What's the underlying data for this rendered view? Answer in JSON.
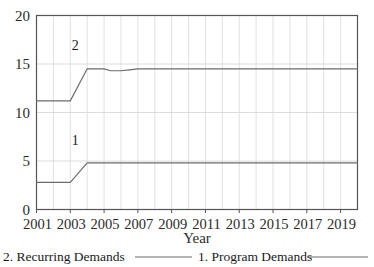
{
  "chart_data": {
    "type": "line",
    "title": "",
    "xlabel": "Year",
    "ylabel": "",
    "xlim": [
      2001,
      2020
    ],
    "ylim": [
      0,
      20
    ],
    "grid": true,
    "legend_position": "bottom",
    "y_ticks": [
      "0",
      "5",
      "10",
      "15",
      "20"
    ],
    "y_tick_values": [
      0,
      5,
      10,
      15,
      20
    ],
    "x_ticks": [
      "2001",
      "2003",
      "2005",
      "2007",
      "2009",
      "2011",
      "2013",
      "2015",
      "2017",
      "2019"
    ],
    "x_tick_values": [
      2001,
      2003,
      2005,
      2007,
      2009,
      2011,
      2013,
      2015,
      2017,
      2019
    ],
    "series": [
      {
        "name": "2. Recurring Demands",
        "tag": "2",
        "color": "#6b6b6b",
        "x": [
          2001,
          2003,
          2004,
          2005,
          2005.4,
          2006,
          2006.5,
          2007,
          2020
        ],
        "values": [
          11.2,
          11.2,
          14.5,
          14.5,
          14.3,
          14.3,
          14.4,
          14.5,
          14.5
        ]
      },
      {
        "name": "1. Program Demands",
        "tag": "1",
        "color": "#6b6b6b",
        "x": [
          2001,
          2003,
          2004,
          2020
        ],
        "values": [
          2.8,
          2.8,
          4.8,
          4.8
        ]
      }
    ],
    "legend": [
      {
        "label": "2. Recurring Demands",
        "color": "#6b6b6b"
      },
      {
        "label": "1. Program Demands",
        "color": "#6b6b6b"
      }
    ],
    "annotations": [
      {
        "text": "2",
        "x": 2003.3,
        "y": 16.4
      },
      {
        "text": "1",
        "x": 2003.3,
        "y": 6.6
      }
    ],
    "colors": {
      "axis": "#555555",
      "grid": "#d9d9d9",
      "line": "#6b6b6b",
      "text": "#1a1a1a",
      "background": "#ffffff"
    }
  }
}
